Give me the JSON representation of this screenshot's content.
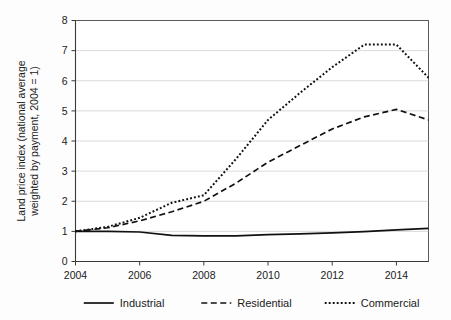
{
  "chart_data": {
    "type": "line",
    "title": "",
    "subtitle": "",
    "xlabel": "",
    "ylabel": "Land price index (national average weighted by payment, 2004 = 1)",
    "ylabel_line1": "Land price index (national average",
    "ylabel_line2": "weighted by payment, 2004 = 1)",
    "xlim": [
      2004,
      2015
    ],
    "ylim": [
      0,
      8
    ],
    "grid": true,
    "grid_orientation": "horizontal",
    "legend_position": "below-axis",
    "y_ticks": [
      "0",
      "1",
      "2",
      "3",
      "4",
      "5",
      "6",
      "7",
      "8"
    ],
    "y_tick_values": [
      0,
      1,
      2,
      3,
      4,
      5,
      6,
      7,
      8
    ],
    "x_ticks": [
      "2004",
      "2006",
      "2008",
      "2010",
      "2012",
      "2014"
    ],
    "x_tick_values": [
      2004,
      2006,
      2008,
      2010,
      2012,
      2014
    ],
    "x": [
      2004,
      2005,
      2006,
      2007,
      2008,
      2009,
      2010,
      2011,
      2012,
      2013,
      2014,
      2015
    ],
    "series": [
      {
        "name": "Industrial",
        "style": "solid",
        "color": "#111111",
        "values": [
          1.0,
          1.0,
          0.98,
          0.87,
          0.85,
          0.85,
          0.89,
          0.92,
          0.95,
          0.99,
          1.05,
          1.1
        ]
      },
      {
        "name": "Residential",
        "style": "dashed",
        "color": "#111111",
        "values": [
          1.0,
          1.12,
          1.35,
          1.65,
          2.0,
          2.6,
          3.3,
          3.85,
          4.4,
          4.8,
          5.05,
          4.7
        ]
      },
      {
        "name": "Commercial",
        "style": "dotted",
        "color": "#111111",
        "values": [
          1.0,
          1.15,
          1.45,
          1.95,
          2.2,
          3.4,
          4.7,
          5.6,
          6.45,
          7.2,
          7.2,
          6.1
        ]
      }
    ],
    "legend": [
      {
        "label": "Industrial",
        "style": "solid"
      },
      {
        "label": "Residential",
        "style": "dashed"
      },
      {
        "label": "Commercial",
        "style": "dotted"
      }
    ],
    "annotations": []
  },
  "figure": {
    "background_color": "#fdfdfd",
    "plot_background_color": "#ffffff",
    "gridline_color": "#c9c9c9",
    "frame_color": "#5a5a5a",
    "ink_color": "#111111"
  }
}
